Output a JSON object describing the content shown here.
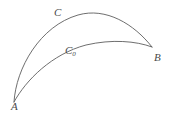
{
  "figure": {
    "background_color": "#ffffff",
    "stroke_color": "#5d5d5d",
    "label_color": "#4a4a4a",
    "width": 175,
    "height": 116
  },
  "points": [
    {
      "id": "A",
      "label": "A",
      "x": 14,
      "y": 102,
      "label_x": 11,
      "label_y": 101
    },
    {
      "id": "B",
      "label": "B",
      "x": 152,
      "y": 47,
      "label_x": 154,
      "label_y": 52
    }
  ],
  "curves": [
    {
      "id": "C",
      "label": "C",
      "label_sub": "",
      "description": "outer upper arc from A to B",
      "label_x": 54,
      "label_y": 7,
      "apex": {
        "x": 90,
        "y": 11
      },
      "path": "M 14 102 C 16 68, 40 26, 78 15 C 106 7, 134 24, 152 47"
    },
    {
      "id": "C0",
      "label": "C",
      "label_sub": "0",
      "description": "inner lower arc from A to B",
      "label_x": 65,
      "label_y": 45,
      "apex": {
        "x": 100,
        "y": 41
      },
      "path": "M 14 102 C 26 80, 52 54, 86 45 C 112 39, 136 41, 152 47"
    }
  ]
}
